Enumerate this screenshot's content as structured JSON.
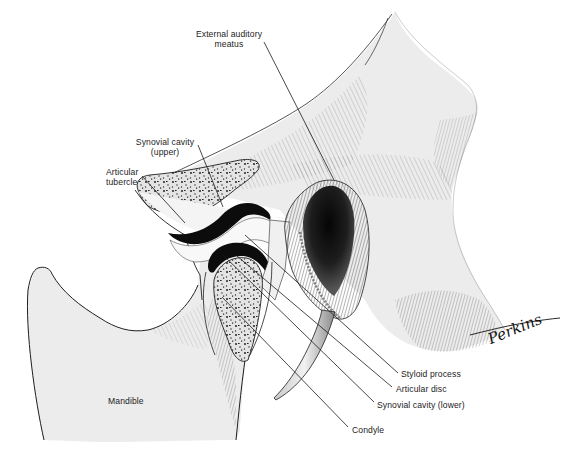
{
  "figure": {
    "signature": "Perkins",
    "colors": {
      "background": "#ffffff",
      "bone_fill": "#ececec",
      "cancellous_fill": "#dcdcdc",
      "cavity": "#111111",
      "line": "#1c1c1c"
    },
    "labels": {
      "external_auditory_meatus": {
        "line1": "External auditory",
        "line2": "meatus"
      },
      "synovial_cavity_upper": {
        "line1": "Synovial cavity",
        "line2": "(upper)"
      },
      "articular_tubercle": {
        "line1": "Articular",
        "line2": "tubercle"
      },
      "styloid_process": "Styloid process",
      "articular_disc": "Articular disc",
      "synovial_cavity_lower": "Synovial cavity (lower)",
      "condyle": "Condyle",
      "mandible": "Mandible"
    }
  }
}
